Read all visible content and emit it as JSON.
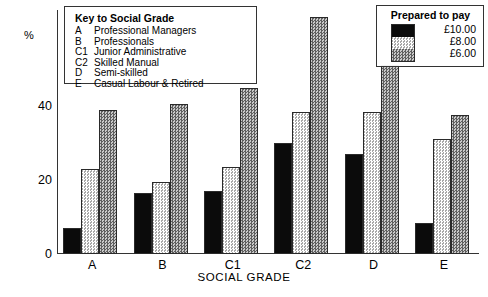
{
  "chart_data": {
    "type": "bar",
    "title": "",
    "xlabel": "SOCIAL GRADE",
    "ylabel": "%",
    "categories": [
      "A",
      "B",
      "C1",
      "C2",
      "D",
      "E"
    ],
    "series": [
      {
        "name": "£10.00",
        "values": [
          7,
          16.5,
          17,
          30,
          27,
          8.5
        ]
      },
      {
        "name": "£8.00",
        "values": [
          23,
          19.5,
          23.5,
          38.5,
          38.5,
          31
        ]
      },
      {
        "name": "£6.00",
        "values": [
          39,
          40.5,
          45,
          64,
          51,
          37.5
        ]
      }
    ],
    "ylim": [
      0,
      66
    ],
    "yticks": [
      0,
      20,
      40
    ],
    "ytick_labels": [
      "0",
      "20",
      "40"
    ],
    "grid": false,
    "legend_position": "top-right"
  },
  "key_box": {
    "title": "Key to Social Grade",
    "rows": [
      {
        "code": "A",
        "desc": "Professional Managers"
      },
      {
        "code": "B",
        "desc": "Professionals"
      },
      {
        "code": "C1",
        "desc": "Junior Administrative"
      },
      {
        "code": "C2",
        "desc": "Skilled Manual"
      },
      {
        "code": "D",
        "desc": "Semi-skilled"
      },
      {
        "code": "E",
        "desc": "Casual Labour & Retired"
      }
    ]
  },
  "legend": {
    "title": "Prepared to pay",
    "entries": [
      {
        "label": "£10.00",
        "swatch": "solid-black"
      },
      {
        "label": "£8.00",
        "swatch": "light-dotted"
      },
      {
        "label": "£6.00",
        "swatch": "dark-hatched"
      }
    ]
  },
  "colors": {
    "series_10": "#0b0b0b",
    "series_8": "#d8d8d8",
    "series_6": "#8d8d8d",
    "axis": "#333333"
  }
}
